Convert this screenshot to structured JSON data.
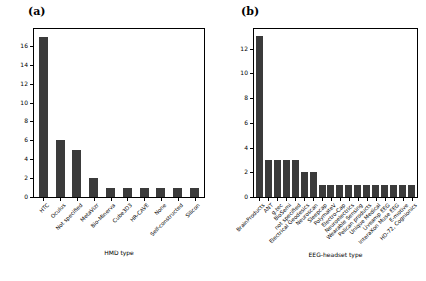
{
  "figure": {
    "background": "#ffffff",
    "bar_color": "#3b3b3b",
    "axis_color": "#000000"
  },
  "panels": [
    {
      "tag": "(a)",
      "name": "panel-a",
      "xlabel": "HMD type",
      "ylabel": "",
      "yticks": [
        "0",
        "2",
        "4",
        "6",
        "8",
        "10",
        "12",
        "14",
        "16"
      ]
    },
    {
      "tag": "(b)",
      "name": "panel-b",
      "xlabel": "EEG-headset type",
      "ylabel": "",
      "yticks": [
        "0",
        "2",
        "4",
        "6",
        "8",
        "10",
        "12"
      ]
    }
  ],
  "chart_data": [
    {
      "type": "bar",
      "title": "(a)",
      "xlabel": "HMD type",
      "ylabel": "",
      "ylim": [
        0,
        17.8
      ],
      "ytick_values": [
        0,
        2,
        4,
        6,
        8,
        10,
        12,
        14,
        16
      ],
      "grid": false,
      "legend": "none",
      "categories": [
        "HTC",
        "Oculus",
        "Not specified",
        "MetaVizr",
        "Bio-Minerva",
        "Cube3D3",
        "HR-CAVE",
        "None",
        "Self-constructed",
        "Silicon"
      ],
      "values": [
        17,
        6,
        5,
        2,
        1,
        1,
        1,
        1,
        1,
        1
      ]
    },
    {
      "type": "bar",
      "title": "(b)",
      "xlabel": "EEG-headset type",
      "ylabel": "",
      "ylim": [
        0,
        13.6
      ],
      "ytick_values": [
        0,
        2,
        4,
        6,
        8,
        10,
        12
      ],
      "grid": false,
      "legend": "none",
      "categories": [
        "BrainProducts",
        "ANT",
        "g.tec",
        "BioSemi",
        "not specified",
        "Electrical Geodesics",
        "Neuroscan",
        "Sleepcap",
        "PolymateV",
        "Electro-Cap",
        "Neuroelectrics",
        "Wearable Sensing",
        "Pelican products",
        "Unique Medical",
        "Liveamp EEG",
        "InteraXon Muse EEG",
        "E-motive",
        "HD-72, Cognionics"
      ],
      "values": [
        13,
        3,
        3,
        3,
        3,
        2,
        2,
        1,
        1,
        1,
        1,
        1,
        1,
        1,
        1,
        1,
        1,
        1
      ]
    }
  ]
}
